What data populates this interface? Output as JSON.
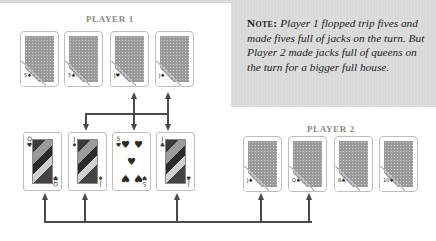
{
  "note": {
    "label": "Note:",
    "text": "Player 1 flopped trip fives and made fives full of jacks on the turn. But Player 2 made jacks full of queens on the turn for a bigger full house."
  },
  "player1": {
    "label": "PLAYER 1",
    "cards": [
      {
        "peek": "5♦",
        "face": "down"
      },
      {
        "peek": "5♠",
        "face": "down"
      },
      {
        "peek": "J♥",
        "face": "down"
      },
      {
        "peek": "J♠",
        "face": "down"
      }
    ]
  },
  "player2": {
    "label": "PLAYER 2",
    "cards": [
      {
        "peek": "J♠",
        "face": "down"
      },
      {
        "peek": "Q♠",
        "face": "down"
      },
      {
        "peek": "8♣",
        "face": "down"
      },
      {
        "peek": "10♦",
        "face": "down"
      }
    ]
  },
  "board": {
    "cards": [
      {
        "rank": "Q",
        "suit": "♥",
        "type": "face"
      },
      {
        "rank": "J",
        "suit": "♦",
        "type": "face"
      },
      {
        "rank": "5",
        "suit": "♥",
        "type": "pip"
      },
      {
        "rank": "J",
        "suit": "♣",
        "type": "face"
      }
    ]
  },
  "colors": {
    "note_bg": "#d9d9d9",
    "arrow": "#4a4a4a",
    "label": "#8a8a8a",
    "card_border": "#bdbdbd"
  }
}
